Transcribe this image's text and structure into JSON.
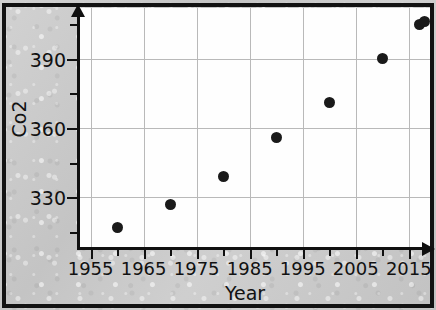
{
  "chart_data": {
    "type": "scatter",
    "title": "",
    "xlabel": "Year",
    "ylabel": "Co2",
    "xlim": [
      1953,
      2019
    ],
    "ylim": [
      308,
      412
    ],
    "grid": true,
    "legend": null,
    "x_ticks": [
      1955,
      1965,
      1975,
      1985,
      1995,
      2005,
      2015
    ],
    "x_tick_labels": [
      "1955",
      "1965",
      "1975",
      "1985",
      "1995",
      "2005",
      "2015"
    ],
    "y_ticks": [
      330,
      360,
      390
    ],
    "y_tick_labels": [
      "330",
      "360",
      "390"
    ],
    "y_minor_ticks": [
      315,
      345,
      375,
      405
    ],
    "marker": {
      "shape": "circle",
      "color": "#1a1a1a",
      "size": 11
    },
    "points": [
      {
        "x": 1960,
        "y": 317
      },
      {
        "x": 1970,
        "y": 327
      },
      {
        "x": 1980,
        "y": 339
      },
      {
        "x": 1990,
        "y": 356
      },
      {
        "x": 2000,
        "y": 371
      },
      {
        "x": 2010,
        "y": 390
      },
      {
        "x": 2017,
        "y": 405
      },
      {
        "x": 2018,
        "y": 406
      }
    ],
    "colors": {
      "plot_background": "#fefefe",
      "figure_background": "#cacaca",
      "grid": "#b9b9b9",
      "axis": "#101010",
      "text": "#111111",
      "frame": "#121212"
    }
  }
}
